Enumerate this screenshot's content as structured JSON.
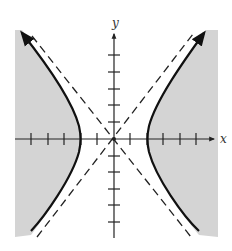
{
  "diagram": {
    "type": "hyperbola-inequality-graph",
    "axes": {
      "x_label": "x",
      "y_label": "y",
      "x_ticks_per_side": 5,
      "y_ticks_per_side": 5
    },
    "curve": {
      "kind": "hyperbola",
      "orientation": "horizontal",
      "vertex_units": 2,
      "asymptote_slope": 1.25,
      "style": "solid",
      "arrows": true
    },
    "asymptotes": {
      "style": "dashed",
      "count": 2
    },
    "shading": {
      "region": "outside branches (left of left branch, right of right branch)",
      "color": "#d4d4d4"
    },
    "colors": {
      "curve": "#111111",
      "axis": "#222222",
      "shade": "#d4d4d4",
      "background": "#ffffff"
    }
  }
}
